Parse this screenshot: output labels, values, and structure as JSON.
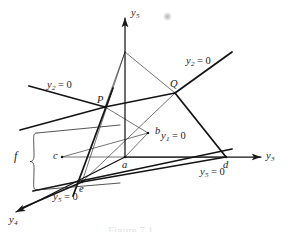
{
  "figure": {
    "type": "geometric-diagram",
    "background_color": "#ffffff",
    "line_color": "#1a1a1a",
    "caption_partial": "Figure 7.1",
    "axes": [
      {
        "id": "y5",
        "name": "y5-axis",
        "label_main": "y",
        "label_sub": "5",
        "direction": "up",
        "tip": [
          125,
          18
        ],
        "origin": [
          125,
          157
        ]
      },
      {
        "id": "y3",
        "name": "y3-axis",
        "label_main": "y",
        "label_sub": "3",
        "direction": "right",
        "tip": [
          261,
          157
        ],
        "origin": [
          125,
          157
        ]
      },
      {
        "id": "y4",
        "name": "y4-axis",
        "label_main": "y",
        "label_sub": "4",
        "direction": "lower-left",
        "tip": [
          16,
          212
        ],
        "origin": [
          125,
          157
        ]
      }
    ],
    "axis_labels": [
      {
        "name": "y5-axis-label",
        "main": "y",
        "sub": "5",
        "x": 131,
        "y": 8
      },
      {
        "name": "y3-axis-label",
        "main": "y",
        "sub": "3",
        "x": 266,
        "y": 151
      },
      {
        "name": "y4-axis-label",
        "main": "y",
        "sub": "4",
        "x": 9,
        "y": 215
      }
    ],
    "plane_labels": [
      {
        "name": "plane-label-y2-left",
        "main": "y",
        "sub": "2",
        "eq": " = 0",
        "x": 47,
        "y": 80
      },
      {
        "name": "plane-label-y2-right",
        "main": "y",
        "sub": "2",
        "eq": " = 0",
        "x": 186,
        "y": 56
      },
      {
        "name": "plane-label-y1",
        "main": "y",
        "sub": "1",
        "eq": " = 0",
        "x": 161,
        "y": 131
      },
      {
        "name": "plane-label-y5-right",
        "main": "y",
        "sub": "5",
        "eq": " = 0",
        "x": 200,
        "y": 167
      },
      {
        "name": "plane-label-y5-bottom",
        "main": "y",
        "sub": "5",
        "eq": " = 0",
        "x": 53,
        "y": 192
      }
    ],
    "points": [
      {
        "name": "point-P",
        "label": "P",
        "px": 105,
        "py": 107,
        "lx": 97,
        "ly": 95,
        "style": "capital"
      },
      {
        "name": "point-Q",
        "label": "Q",
        "px": 175,
        "py": 93,
        "lx": 170,
        "ly": 79,
        "style": "capital"
      },
      {
        "name": "point-a",
        "label": "a",
        "px": 125,
        "py": 157,
        "lx": 122,
        "ly": 160,
        "style": "lower"
      },
      {
        "name": "point-b",
        "label": "b",
        "px": 148,
        "py": 133,
        "lx": 155,
        "ly": 126,
        "style": "lower"
      },
      {
        "name": "point-c",
        "label": "c",
        "px": 62,
        "py": 157,
        "lx": 53,
        "ly": 151,
        "style": "lower"
      },
      {
        "name": "point-d",
        "label": "d",
        "px": 226,
        "py": 157,
        "lx": 223,
        "ly": 160,
        "style": "lower"
      },
      {
        "name": "point-e",
        "label": "e",
        "px": 82,
        "py": 182,
        "lx": 79,
        "ly": 184,
        "style": "lower"
      }
    ],
    "brace": {
      "name": "brace-f",
      "label": "f",
      "label_x": 14,
      "label_y": 150,
      "top_y": 133,
      "bottom_y": 190,
      "x": 31
    },
    "smudge": {
      "name": "gray-smudge-artifact",
      "x": 163,
      "y": 12,
      "size": 9
    },
    "apex": {
      "name": "triangle-apex",
      "x": 125,
      "y": 52
    },
    "thick_segments": [
      {
        "name": "segment-y2-left-to-P",
        "x1": 29,
        "y1": 86,
        "x2": 105,
        "y2": 107
      },
      {
        "name": "segment-P-to-Q",
        "x1": 105,
        "y1": 107,
        "x2": 175,
        "y2": 93
      },
      {
        "name": "segment-Q-to-y2-right",
        "x1": 175,
        "y1": 93,
        "x2": 232,
        "y2": 52
      },
      {
        "name": "segment-Q-to-d",
        "x1": 175,
        "y1": 93,
        "x2": 226,
        "y2": 157
      },
      {
        "name": "segment-e-to-d",
        "x1": 82,
        "y1": 182,
        "x2": 226,
        "y2": 157
      },
      {
        "name": "segment-P-to-e-ext",
        "x1": 113,
        "y1": 88,
        "x2": 73,
        "y2": 196
      },
      {
        "name": "segment-e-to-y4",
        "x1": 82,
        "y1": 182,
        "x2": 22,
        "y2": 208
      },
      {
        "name": "segment-Pline-left",
        "x1": 20,
        "y1": 130,
        "x2": 105,
        "y2": 107
      },
      {
        "name": "segment-long-base",
        "x1": 33,
        "y1": 191,
        "x2": 232,
        "y2": 149
      }
    ],
    "thin_segments": [
      {
        "name": "segment-apex-to-P",
        "x1": 125,
        "y1": 52,
        "x2": 105,
        "y2": 107
      },
      {
        "name": "segment-apex-to-Q",
        "x1": 125,
        "y1": 52,
        "x2": 175,
        "y2": 93
      },
      {
        "name": "segment-c-to-b",
        "x1": 62,
        "y1": 157,
        "x2": 148,
        "y2": 133
      },
      {
        "name": "segment-c-to-a",
        "x1": 62,
        "y1": 157,
        "x2": 125,
        "y2": 157
      },
      {
        "name": "segment-a-to-b",
        "x1": 125,
        "y1": 157,
        "x2": 148,
        "y2": 133
      },
      {
        "name": "segment-P-to-b",
        "x1": 105,
        "y1": 107,
        "x2": 148,
        "y2": 133
      },
      {
        "name": "segment-e-to-Q",
        "x1": 82,
        "y1": 182,
        "x2": 175,
        "y2": 93
      },
      {
        "name": "segment-e-to-apex",
        "x1": 82,
        "y1": 182,
        "x2": 125,
        "y2": 52
      },
      {
        "name": "segment-a-to-d",
        "x1": 125,
        "y1": 157,
        "x2": 226,
        "y2": 157
      }
    ]
  }
}
